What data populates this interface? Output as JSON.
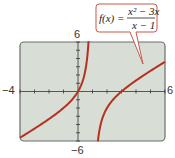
{
  "chart_data": {
    "type": "line",
    "title": "",
    "function": "f(x) = (x^2 - 3x)/(x - 1)",
    "vertical_asymptote": 1,
    "xlim": [
      -4,
      6
    ],
    "ylim": [
      -6,
      6
    ],
    "grid": false,
    "xlabel": "",
    "ylabel": "",
    "tick_labels": {
      "x_min": "−4",
      "x_max": "6",
      "y_max": "6",
      "y_min": "−6"
    },
    "series": [
      {
        "name": "f(x) left branch",
        "x": [
          -4,
          -3,
          -2,
          -1,
          0,
          0.5,
          0.75
        ],
        "values": [
          -5.6,
          -4.5,
          -3.33,
          -2,
          0,
          1.25,
          6.75
        ]
      },
      {
        "name": "f(x) right branch",
        "x": [
          1.4,
          2,
          3,
          4,
          5,
          6
        ],
        "values": [
          -3.6,
          -2,
          0,
          1.33,
          2.5,
          3.6
        ]
      }
    ],
    "line_color": "#b5301f",
    "plot_background": "#d8ddd6"
  },
  "callout": {
    "lhs": "f(x) =",
    "numerator": "x² − 3x",
    "denominator": "x − 1"
  }
}
